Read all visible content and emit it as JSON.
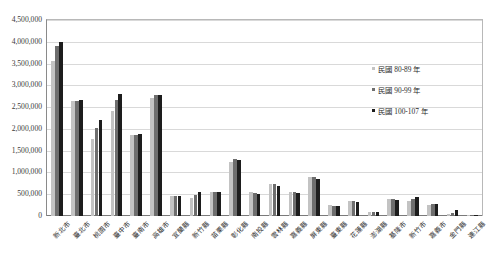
{
  "chart_data": {
    "type": "bar",
    "title": "",
    "xlabel": "",
    "ylabel": "",
    "ylim": [
      0,
      4500000
    ],
    "ytick_step": 500000,
    "grid": true,
    "legend_position": "right-inside",
    "ytick_labels": [
      "0",
      "500,000",
      "1,000,000",
      "1,500,000",
      "2,000,000",
      "2,500,000",
      "3,000,000",
      "3,500,000",
      "4,000,000",
      "4,500,000"
    ],
    "categories": [
      "新北市",
      "臺北市",
      "桃園市",
      "臺中市",
      "臺南市",
      "高雄市",
      "宜蘭縣",
      "新竹縣",
      "苗栗縣",
      "彰化縣",
      "南投縣",
      "雲林縣",
      "嘉義縣",
      "屏東縣",
      "臺東縣",
      "花蓮縣",
      "澎湖縣",
      "基隆市",
      "新竹市",
      "嘉義市",
      "金門縣",
      "連江縣"
    ],
    "series": [
      {
        "name": "民國 80-89 年",
        "color": "#c3c3c3",
        "values": [
          3550000,
          2630000,
          1760000,
          2420000,
          1860000,
          2720000,
          450000,
          420000,
          550000,
          1250000,
          540000,
          740000,
          560000,
          900000,
          250000,
          350000,
          92000,
          390000,
          340000,
          260000,
          50000,
          6000
        ]
      },
      {
        "name": "民國 90-99 年",
        "color": "#6e6e6e",
        "values": [
          3900000,
          2630000,
          2010000,
          2660000,
          1870000,
          2770000,
          460000,
          490000,
          560000,
          1310000,
          530000,
          730000,
          540000,
          890000,
          240000,
          340000,
          94000,
          385000,
          400000,
          270000,
          80000,
          9000
        ]
      },
      {
        "name": "民國 100-107 年",
        "color": "#1d1d1d",
        "values": [
          4000000,
          2660000,
          2200000,
          2800000,
          1880000,
          2780000,
          455000,
          540000,
          550000,
          1280000,
          510000,
          700000,
          520000,
          840000,
          220000,
          330000,
          102000,
          372000,
          435000,
          270000,
          130000,
          12000
        ]
      }
    ]
  },
  "legend": {
    "items": [
      {
        "label": "民國 80-89 年"
      },
      {
        "label": "民國 90-99 年"
      },
      {
        "label": "民國 100-107 年"
      }
    ]
  }
}
